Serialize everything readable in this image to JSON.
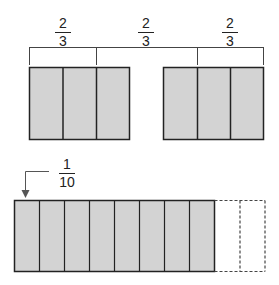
{
  "top_fractions": [
    {
      "numerator": "2",
      "denominator": "3"
    },
    {
      "numerator": "2",
      "denominator": "3"
    },
    {
      "numerator": "2",
      "denominator": "3"
    }
  ],
  "bottom_fraction": {
    "numerator": "1",
    "denominator": "10"
  },
  "colors": {
    "fill": "#d3d3d3",
    "stroke": "#222222",
    "dashed": "#444444"
  },
  "diagram": {
    "top_left_rect_parts": 3,
    "top_right_rect_parts": 3,
    "bottom_rect_total_parts": 10,
    "bottom_rect_shaded_parts": 8
  }
}
